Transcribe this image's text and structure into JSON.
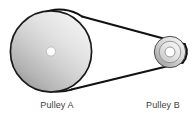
{
  "diagram": {
    "background_color": "#ffffff",
    "width": 194,
    "height": 117,
    "stroke_color": "#1a1a1a",
    "belt": {
      "name": "drive-belt",
      "color": "#111111",
      "width_px": 2,
      "top_span": {
        "x1": 82,
        "y1": 16.5,
        "x2": 184.5,
        "y2": 44.5
      },
      "bottom_span": {
        "x1": 71.5,
        "y1": 89.5,
        "x2": 182.5,
        "y2": 62.5
      }
    },
    "pulleys": [
      {
        "id": "pulley-a",
        "label": "Pulley A",
        "role": "large-driver-pulley",
        "cx": 51,
        "cy": 51.5,
        "outer_radius": 41,
        "hub_radius": 4.6,
        "face_color_light": "#e9e9e9",
        "face_color_dark": "#9d9d9d",
        "hub_color": "#ffffff"
      },
      {
        "id": "pulley-b",
        "label": "Pulley B",
        "role": "small-driven-pulley",
        "cx": 170,
        "cy": 52,
        "outer_radius": 16,
        "inner_radius": 11,
        "hub_radius": 5,
        "face_color_light": "#ededed",
        "face_color_dark": "#a8a8a8",
        "hub_color": "#ffffff"
      }
    ],
    "labels": {
      "pulley_a": "Pulley A",
      "pulley_b": "Pulley B",
      "text_color": "#3d3d3d"
    }
  }
}
